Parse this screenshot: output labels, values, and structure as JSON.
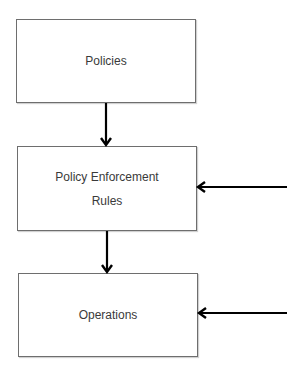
{
  "diagram": {
    "type": "flowchart",
    "nodes": [
      {
        "id": "policies",
        "lines": [
          "Policies"
        ]
      },
      {
        "id": "policy-enforcement-rules",
        "lines": [
          "Policy Enforcement",
          "Rules"
        ]
      },
      {
        "id": "operations",
        "lines": [
          "Operations"
        ]
      }
    ],
    "edges": [
      {
        "from": "policies",
        "to": "policy-enforcement-rules",
        "direction": "down"
      },
      {
        "from": "policy-enforcement-rules",
        "to": "operations",
        "direction": "down"
      },
      {
        "from": "external-right",
        "to": "policy-enforcement-rules",
        "direction": "left"
      },
      {
        "from": "external-right",
        "to": "operations",
        "direction": "left"
      }
    ],
    "colors": {
      "border": "#6e6e6e",
      "arrow": "#000000",
      "text": "#3a3a3a",
      "background": "#ffffff"
    }
  }
}
